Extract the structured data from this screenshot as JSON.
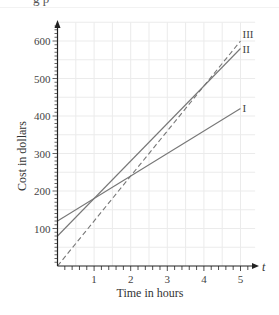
{
  "header": {
    "fragment": "g p"
  },
  "chart_data": {
    "type": "line",
    "title": "",
    "xlabel": "Time in hours",
    "ylabel": "Cost in dollars",
    "x_axis_symbol": "t",
    "xlim": [
      0,
      5.5
    ],
    "ylim": [
      0,
      650
    ],
    "x_ticks": [
      1,
      2,
      3,
      4,
      5
    ],
    "x_tick_labels": [
      "1",
      "2",
      "3",
      "4",
      "5"
    ],
    "y_ticks": [
      100,
      200,
      300,
      400,
      500,
      600
    ],
    "y_tick_labels": [
      "100",
      "200",
      "300",
      "400",
      "500",
      "600"
    ],
    "x_minor_tick_step": 0.2,
    "y_minor_tick_step": 10,
    "grid": true,
    "grid_step_x": 0.5,
    "grid_step_y": 50,
    "legend_position": "line-end labels",
    "series": [
      {
        "name": "I",
        "style": "solid",
        "x": [
          0,
          5
        ],
        "values": [
          120,
          420
        ]
      },
      {
        "name": "II",
        "style": "solid",
        "x": [
          0,
          5
        ],
        "values": [
          80,
          580
        ]
      },
      {
        "name": "III",
        "style": "dashed",
        "x": [
          0,
          5
        ],
        "values": [
          0,
          600
        ]
      }
    ],
    "colors": {
      "line": "#777777",
      "axis": "#222222",
      "grid": "#ebebeb"
    }
  }
}
